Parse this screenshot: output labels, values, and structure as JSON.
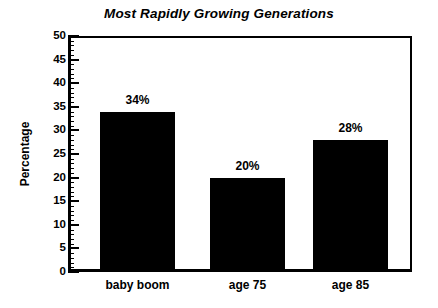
{
  "chart_data": {
    "type": "bar",
    "title": "Most Rapidly Growing Generations",
    "xlabel": "",
    "ylabel": "Percentage",
    "categories": [
      "baby boom",
      "age 75",
      "age 85"
    ],
    "values": [
      34,
      20,
      28
    ],
    "data_labels": [
      "34%",
      "20%",
      "28%"
    ],
    "ylim": [
      0,
      50
    ],
    "ytick_step": 5,
    "yticks": [
      0,
      5,
      10,
      15,
      20,
      25,
      30,
      35,
      40,
      45,
      50
    ],
    "ytick_labels": [
      "0",
      "5",
      "10",
      "15",
      "20",
      "25",
      "30",
      "35",
      "40",
      "45",
      "50"
    ],
    "minor_tick_step": 1,
    "grid": false,
    "legend": false,
    "bar_color": "#000000",
    "background_color": "#ffffff",
    "axis_color": "#000000"
  }
}
